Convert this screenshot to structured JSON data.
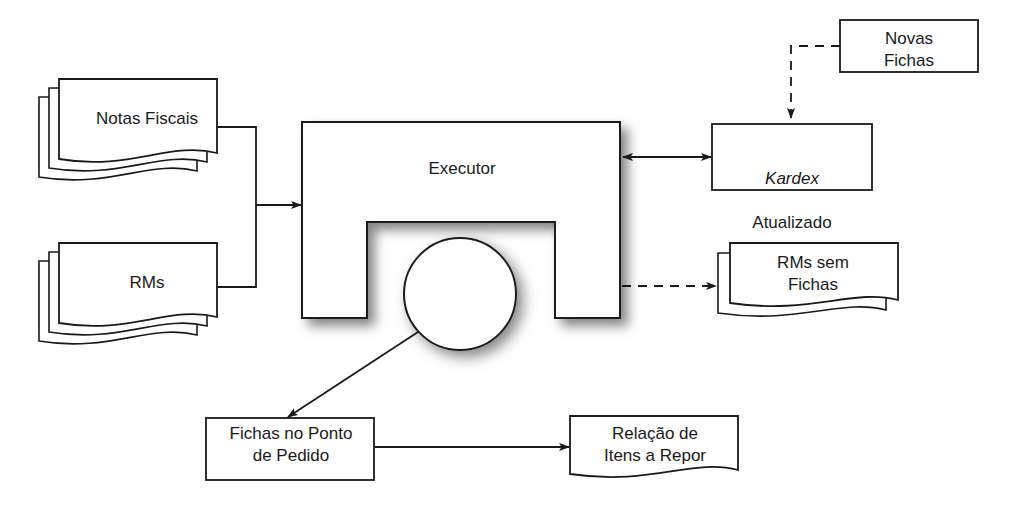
{
  "diagram": {
    "colors": {
      "stroke": "#1a1a1a",
      "text": "#1a1a1a",
      "background": "#ffffff",
      "shadow": "#7a7a7a"
    },
    "nodes": {
      "notas_fiscais": {
        "label": "Notas Fiscais",
        "shape": "document-stack",
        "layers": 3
      },
      "rms": {
        "label": "RMs",
        "shape": "document-stack",
        "layers": 3
      },
      "executor": {
        "label": "Executor",
        "shape": "arch"
      },
      "circle": {
        "label": "",
        "shape": "circle"
      },
      "novas_fichas": {
        "label": "Novas\nFichas",
        "shape": "rectangle"
      },
      "kardex_atualizado": {
        "label_italic": "Kardex",
        "label_plain": "Atualizado",
        "label": "Kardex\nAtualizado",
        "shape": "rectangle"
      },
      "rms_sem_fichas": {
        "label": "RMs sem\nFichas",
        "shape": "document-stack",
        "layers": 2
      },
      "fichas_ponto_pedido": {
        "label": "Fichas no Ponto\nde Pedido",
        "shape": "rectangle"
      },
      "relacao_itens_repor": {
        "label": "Relação de\nItens a Repor",
        "shape": "document"
      }
    },
    "connectors": [
      {
        "name": "notas-to-bus",
        "style": "solid",
        "arrow": "none"
      },
      {
        "name": "rms-to-bus",
        "style": "solid",
        "arrow": "none"
      },
      {
        "name": "bus-to-executor",
        "style": "solid",
        "arrow": "end"
      },
      {
        "name": "executor-to-kardex",
        "style": "solid",
        "arrow": "both"
      },
      {
        "name": "novas-fichas-to-kardex",
        "style": "dashed",
        "arrow": "end"
      },
      {
        "name": "executor-to-rms-sem-fichas",
        "style": "dashed",
        "arrow": "end"
      },
      {
        "name": "circle-to-fichas-ponto",
        "style": "solid",
        "arrow": "end"
      },
      {
        "name": "fichas-ponto-to-relacao",
        "style": "solid",
        "arrow": "end"
      }
    ]
  }
}
